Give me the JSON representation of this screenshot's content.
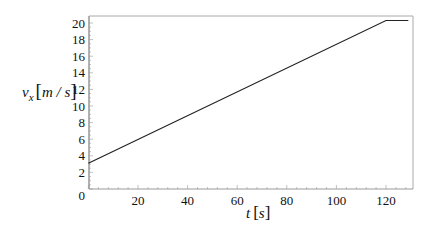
{
  "chart_data": {
    "type": "line",
    "title": "",
    "xlabel": "t [s]",
    "ylabel": "v_x [m / s]",
    "xlabel_parts": {
      "var": "t",
      "unit": "s"
    },
    "ylabel_parts": {
      "var": "v",
      "sub": "x",
      "unit": "m / s"
    },
    "xlim": [
      0,
      130
    ],
    "ylim": [
      0,
      20.5
    ],
    "x_ticks": [
      20,
      40,
      60,
      80,
      100,
      120
    ],
    "y_ticks": [
      0,
      2,
      4,
      6,
      8,
      10,
      12,
      14,
      16,
      18,
      20
    ],
    "grid": false,
    "legend": null,
    "series": [
      {
        "name": "v_x",
        "color": "#222222",
        "x": [
          0,
          120,
          129
        ],
        "y": [
          3.1,
          20.3,
          20.3
        ]
      }
    ]
  },
  "colors": {
    "line": "#222222",
    "axis": "#999999",
    "frame": "#aaaaaa",
    "text": "#111111"
  }
}
